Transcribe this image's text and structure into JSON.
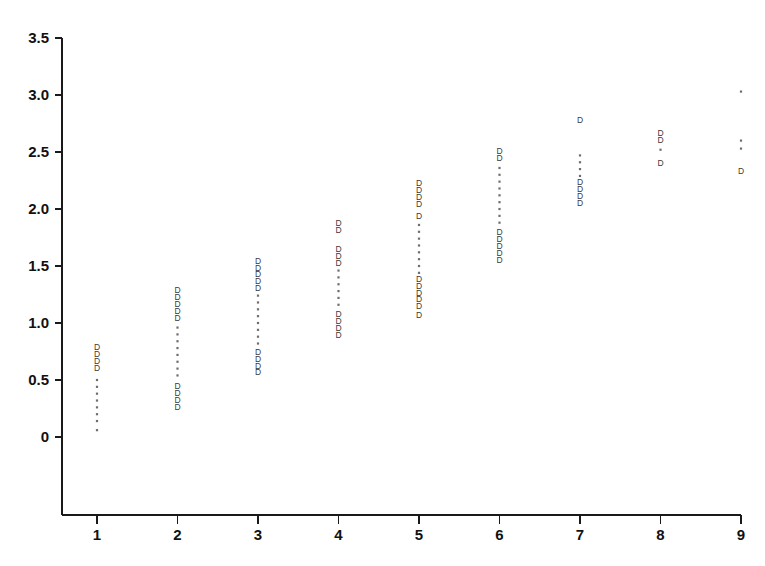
{
  "chart_data": {
    "type": "scatter",
    "title": "",
    "subtitle": "",
    "xlabel": "",
    "ylabel": "",
    "xlim": [
      0.5,
      9.5
    ],
    "ylim": [
      -0.25,
      3.5
    ],
    "grid": false,
    "legend": null,
    "marker_styles": {
      "D": "letter-D glyph marker",
      "dot": "small square dot marker"
    },
    "x_tick_labels": [
      "1",
      "2",
      "3",
      "4",
      "5",
      "6",
      "7",
      "8",
      "9"
    ],
    "x_tick_values": [
      1,
      2,
      3,
      4,
      5,
      6,
      7,
      8,
      9
    ],
    "y_tick_labels": [
      "0",
      "0.5",
      "1.0",
      "1.5",
      "2.0",
      "2.5",
      "3.0",
      "3.5"
    ],
    "y_tick_values": [
      0,
      0.5,
      1.0,
      1.5,
      2.0,
      2.5,
      3.0,
      3.5
    ],
    "series": [
      {
        "name": "D",
        "marker": "D",
        "points": [
          {
            "x": 1,
            "y": 0.78
          },
          {
            "x": 1,
            "y": 0.72
          },
          {
            "x": 1,
            "y": 0.66
          },
          {
            "x": 1,
            "y": 0.6
          },
          {
            "x": 2,
            "y": 1.28
          },
          {
            "x": 2,
            "y": 1.22
          },
          {
            "x": 2,
            "y": 1.16
          },
          {
            "x": 2,
            "y": 1.1
          },
          {
            "x": 2,
            "y": 1.04
          },
          {
            "x": 2,
            "y": 0.44
          },
          {
            "x": 2,
            "y": 0.38
          },
          {
            "x": 2,
            "y": 0.32
          },
          {
            "x": 2,
            "y": 0.26
          },
          {
            "x": 3,
            "y": 1.54
          },
          {
            "x": 3,
            "y": 1.48
          },
          {
            "x": 3,
            "y": 1.42
          },
          {
            "x": 3,
            "y": 1.36
          },
          {
            "x": 3,
            "y": 1.3
          },
          {
            "x": 3,
            "y": 0.74
          },
          {
            "x": 3,
            "y": 0.68
          },
          {
            "x": 3,
            "y": 0.62
          },
          {
            "x": 3,
            "y": 0.56
          },
          {
            "x": 4,
            "y": 1.87
          },
          {
            "x": 4,
            "y": 1.81
          },
          {
            "x": 4,
            "y": 1.64
          },
          {
            "x": 4,
            "y": 1.58
          },
          {
            "x": 4,
            "y": 1.52
          },
          {
            "x": 4,
            "y": 1.07
          },
          {
            "x": 4,
            "y": 1.01
          },
          {
            "x": 4,
            "y": 0.95
          },
          {
            "x": 4,
            "y": 0.89
          },
          {
            "x": 5,
            "y": 2.22
          },
          {
            "x": 5,
            "y": 2.16
          },
          {
            "x": 5,
            "y": 2.1
          },
          {
            "x": 5,
            "y": 2.04
          },
          {
            "x": 5,
            "y": 1.93
          },
          {
            "x": 5,
            "y": 1.38
          },
          {
            "x": 5,
            "y": 1.32
          },
          {
            "x": 5,
            "y": 1.26
          },
          {
            "x": 5,
            "y": 1.2
          },
          {
            "x": 5,
            "y": 1.14
          },
          {
            "x": 5,
            "y": 1.06
          },
          {
            "x": 6,
            "y": 2.5
          },
          {
            "x": 6,
            "y": 2.44
          },
          {
            "x": 6,
            "y": 1.79
          },
          {
            "x": 6,
            "y": 1.73
          },
          {
            "x": 6,
            "y": 1.67
          },
          {
            "x": 6,
            "y": 1.61
          },
          {
            "x": 6,
            "y": 1.55
          },
          {
            "x": 7,
            "y": 2.77
          },
          {
            "x": 7,
            "y": 2.23
          },
          {
            "x": 7,
            "y": 2.17
          },
          {
            "x": 7,
            "y": 2.11
          },
          {
            "x": 7,
            "y": 2.05
          },
          {
            "x": 8,
            "y": 2.66
          },
          {
            "x": 8,
            "y": 2.6
          },
          {
            "x": 8,
            "y": 2.4
          },
          {
            "x": 9,
            "y": 2.33
          }
        ]
      },
      {
        "name": "dot",
        "marker": "dot",
        "points": [
          {
            "x": 1,
            "y": 0.5
          },
          {
            "x": 1,
            "y": 0.44
          },
          {
            "x": 1,
            "y": 0.38
          },
          {
            "x": 1,
            "y": 0.32
          },
          {
            "x": 1,
            "y": 0.26
          },
          {
            "x": 1,
            "y": 0.2
          },
          {
            "x": 1,
            "y": 0.14
          },
          {
            "x": 1,
            "y": 0.06
          },
          {
            "x": 2,
            "y": 0.96
          },
          {
            "x": 2,
            "y": 0.9
          },
          {
            "x": 2,
            "y": 0.84
          },
          {
            "x": 2,
            "y": 0.78
          },
          {
            "x": 2,
            "y": 0.72
          },
          {
            "x": 2,
            "y": 0.66
          },
          {
            "x": 2,
            "y": 0.6
          },
          {
            "x": 2,
            "y": 0.54
          },
          {
            "x": 3,
            "y": 1.24
          },
          {
            "x": 3,
            "y": 1.18
          },
          {
            "x": 3,
            "y": 1.12
          },
          {
            "x": 3,
            "y": 1.06
          },
          {
            "x": 3,
            "y": 1.0
          },
          {
            "x": 3,
            "y": 0.94
          },
          {
            "x": 3,
            "y": 0.88
          },
          {
            "x": 3,
            "y": 0.82
          },
          {
            "x": 4,
            "y": 1.46
          },
          {
            "x": 4,
            "y": 1.4
          },
          {
            "x": 4,
            "y": 1.34
          },
          {
            "x": 4,
            "y": 1.28
          },
          {
            "x": 4,
            "y": 1.22
          },
          {
            "x": 4,
            "y": 1.16
          },
          {
            "x": 5,
            "y": 1.86
          },
          {
            "x": 5,
            "y": 1.8
          },
          {
            "x": 5,
            "y": 1.74
          },
          {
            "x": 5,
            "y": 1.68
          },
          {
            "x": 5,
            "y": 1.62
          },
          {
            "x": 5,
            "y": 1.56
          },
          {
            "x": 5,
            "y": 1.5
          },
          {
            "x": 5,
            "y": 1.44
          },
          {
            "x": 6,
            "y": 2.36
          },
          {
            "x": 6,
            "y": 2.3
          },
          {
            "x": 6,
            "y": 2.24
          },
          {
            "x": 6,
            "y": 2.18
          },
          {
            "x": 6,
            "y": 2.12
          },
          {
            "x": 6,
            "y": 2.06
          },
          {
            "x": 6,
            "y": 2.0
          },
          {
            "x": 6,
            "y": 1.94
          },
          {
            "x": 6,
            "y": 1.88
          },
          {
            "x": 7,
            "y": 2.47
          },
          {
            "x": 7,
            "y": 2.41
          },
          {
            "x": 7,
            "y": 2.35
          },
          {
            "x": 7,
            "y": 2.29
          },
          {
            "x": 8,
            "y": 2.52
          },
          {
            "x": 9,
            "y": 3.03
          },
          {
            "x": 9,
            "y": 2.6
          },
          {
            "x": 9,
            "y": 2.53
          }
        ]
      }
    ]
  },
  "axes": {
    "y_axis_name": "value-axis",
    "x_axis_name": "category-axis"
  }
}
